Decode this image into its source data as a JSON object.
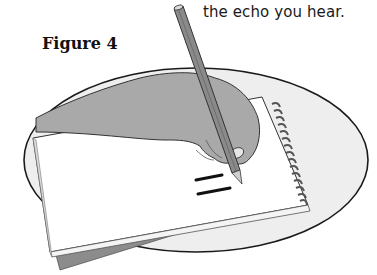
{
  "page": {
    "body_text_fragment": "the echo you hear.",
    "figure_label": "Figure 4"
  },
  "illustration": {
    "description": "Hand holding a pencil writing an equals sign on a spiral notebook, shown on an oval background",
    "subjects": [
      "hand",
      "pencil",
      "spiral-notebook",
      "equals-sign",
      "oval-background"
    ],
    "colors": {
      "oval_fill": "#eeeeee",
      "outline": "#1a1a1a",
      "hand_fill": "#a9a9a9",
      "pencil_fill": "#8a8a8a",
      "notebook_fill": "#ffffff",
      "notebook_back": "#8c8c8c"
    }
  }
}
